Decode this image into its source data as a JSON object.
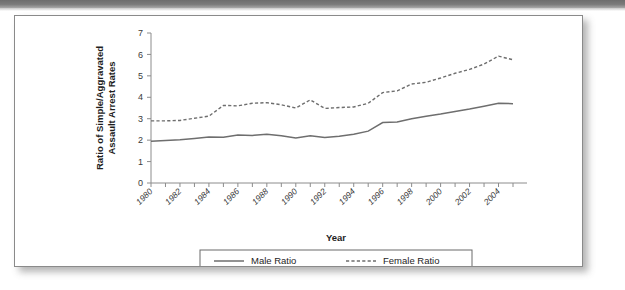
{
  "chart_data": {
    "type": "line",
    "title": "",
    "xlabel": "Year",
    "ylabel": "Ratio of Simple/Aggravated Assault Arrest Rates",
    "ylabel_line1": "Ratio of Simple/Aggravated",
    "ylabel_line2": "Assault Arrest Rates",
    "xlim": [
      1980,
      2005
    ],
    "ylim": [
      0,
      7
    ],
    "grid": false,
    "legend_position": "bottom",
    "y_ticks": [
      0,
      1,
      2,
      3,
      4,
      5,
      6,
      7
    ],
    "x_ticks": [
      1980,
      1981,
      1982,
      1983,
      1984,
      1985,
      1986,
      1987,
      1988,
      1989,
      1990,
      1991,
      1992,
      1993,
      1994,
      1995,
      1996,
      1997,
      1998,
      1999,
      2000,
      2001,
      2002,
      2003,
      2004,
      2005
    ],
    "x_tick_labels_shown": [
      "1980",
      "1982",
      "1984",
      "1986",
      "1988",
      "1990",
      "1992",
      "1994",
      "1996",
      "1998",
      "2000",
      "2002",
      "2004"
    ],
    "x": [
      1980,
      1981,
      1982,
      1983,
      1984,
      1985,
      1986,
      1987,
      1988,
      1989,
      1990,
      1991,
      1992,
      1993,
      1994,
      1995,
      1996,
      1997,
      1998,
      1999,
      2000,
      2001,
      2002,
      2003,
      2004,
      2005
    ],
    "series": [
      {
        "name": "Male Ratio",
        "style": "solid",
        "color": "#6e6e6e",
        "values": [
          1.95,
          1.98,
          2.02,
          2.08,
          2.15,
          2.14,
          2.24,
          2.22,
          2.28,
          2.2,
          2.1,
          2.2,
          2.12,
          2.18,
          2.28,
          2.42,
          2.82,
          2.85,
          3.0,
          3.12,
          3.22,
          3.34,
          3.45,
          3.58,
          3.72,
          3.7
        ]
      },
      {
        "name": "Female Ratio",
        "style": "dashed",
        "color": "#6e6e6e",
        "values": [
          2.9,
          2.9,
          2.92,
          3.02,
          3.12,
          3.62,
          3.6,
          3.72,
          3.75,
          3.65,
          3.5,
          3.88,
          3.48,
          3.52,
          3.55,
          3.72,
          4.22,
          4.3,
          4.62,
          4.7,
          4.9,
          5.12,
          5.3,
          5.55,
          5.92,
          5.75
        ]
      }
    ],
    "legend": [
      {
        "label": "Male Ratio",
        "style": "solid"
      },
      {
        "label": "Female Ratio",
        "style": "dashed"
      }
    ]
  }
}
